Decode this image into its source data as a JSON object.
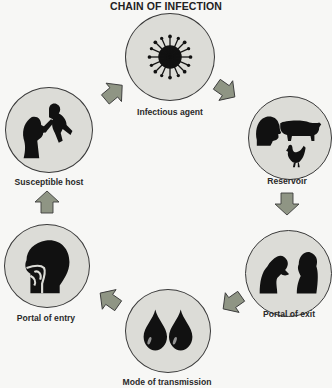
{
  "title": "CHAIN OF INFECTION",
  "colors": {
    "background": "#f7f7f5",
    "circle_fill": "#dcdcd7",
    "circle_stroke": "#3a3a3a",
    "arrow_fill": "#8f9584",
    "arrow_stroke": "#3c3c3c",
    "silhouette": "#111111"
  },
  "nodes": [
    {
      "id": "infectious-agent",
      "label": "Infectious agent",
      "icon": "virus-icon"
    },
    {
      "id": "reservoir",
      "label": "Reservoir",
      "icon": "human-pig-chicken-icon"
    },
    {
      "id": "portal-of-exit",
      "label": "Portal of exit",
      "icon": "coughing-people-icon"
    },
    {
      "id": "mode-of-transmission",
      "label": "Mode of transmission",
      "icon": "droplets-icon"
    },
    {
      "id": "portal-of-entry",
      "label": "Portal of entry",
      "icon": "head-airway-icon"
    },
    {
      "id": "susceptible-host",
      "label": "Susceptible host",
      "icon": "mother-baby-icon"
    }
  ],
  "flow": [
    {
      "from": "infectious-agent",
      "to": "reservoir"
    },
    {
      "from": "reservoir",
      "to": "portal-of-exit"
    },
    {
      "from": "portal-of-exit",
      "to": "mode-of-transmission"
    },
    {
      "from": "mode-of-transmission",
      "to": "portal-of-entry"
    },
    {
      "from": "portal-of-entry",
      "to": "susceptible-host"
    },
    {
      "from": "susceptible-host",
      "to": "infectious-agent"
    }
  ]
}
